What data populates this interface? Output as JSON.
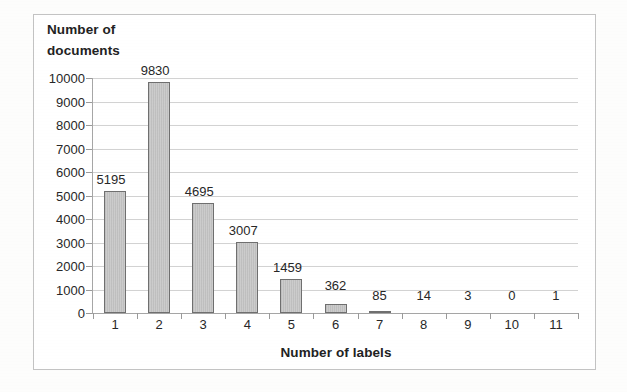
{
  "chart_data": {
    "type": "bar",
    "title": "",
    "xlabel": "Number of labels",
    "ylabel": "Number of documents",
    "categories": [
      "1",
      "2",
      "3",
      "4",
      "5",
      "6",
      "7",
      "8",
      "9",
      "10",
      "11"
    ],
    "values": [
      5195,
      9830,
      4695,
      3007,
      1459,
      362,
      85,
      14,
      3,
      0,
      1
    ],
    "data_labels": [
      "5195",
      "9830",
      "4695",
      "3007",
      "1459",
      "362",
      "85",
      "14",
      "3",
      "0",
      "1"
    ],
    "ylim": [
      0,
      10000
    ],
    "ytick_labels": [
      "0",
      "1000",
      "2000",
      "3000",
      "4000",
      "5000",
      "6000",
      "7000",
      "8000",
      "9000",
      "10000"
    ],
    "ytick_values": [
      0,
      1000,
      2000,
      3000,
      4000,
      5000,
      6000,
      7000,
      8000,
      9000,
      10000
    ],
    "grid": "horizontal",
    "legend": "none",
    "bar_color": "#c9c9c9",
    "bar_border_color": "#6f6f6f",
    "gridline_color": "#d2d2d2",
    "axis_color": "#a6a6a6",
    "text_color": "#272727"
  },
  "axis_titles": {
    "y_title": "Number of\ndocuments",
    "x_title": "Number of labels"
  }
}
